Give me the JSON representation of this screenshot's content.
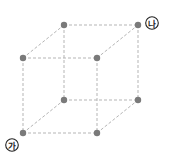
{
  "diagram": {
    "type": "cube-wireframe",
    "edge_style": "dashed",
    "edge_color": "#b5b5b5",
    "vertex_color": "#7a7a7a",
    "vertices": [
      {
        "id": "front-top-left",
        "x": 23,
        "y": 58
      },
      {
        "id": "front-top-right",
        "x": 97,
        "y": 58
      },
      {
        "id": "front-bottom-left",
        "x": 23,
        "y": 133
      },
      {
        "id": "front-bottom-right",
        "x": 97,
        "y": 133
      },
      {
        "id": "back-top-left",
        "x": 64,
        "y": 25
      },
      {
        "id": "back-top-right",
        "x": 138,
        "y": 25
      },
      {
        "id": "back-bottom-left",
        "x": 64,
        "y": 100
      },
      {
        "id": "back-bottom-right",
        "x": 138,
        "y": 100
      }
    ],
    "labels": [
      {
        "id": "label-ga",
        "text": "가",
        "vertex": "front-bottom-left",
        "x": 12,
        "y": 145
      },
      {
        "id": "label-na",
        "text": "나",
        "vertex": "back-top-right",
        "x": 152,
        "y": 23
      }
    ]
  }
}
